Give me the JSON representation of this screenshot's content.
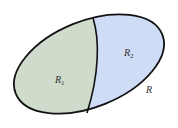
{
  "diagram": {
    "type": "region-partition",
    "region": {
      "label": "R",
      "shape": "ellipse"
    },
    "subregions": [
      {
        "label": "R",
        "subscript": "1",
        "fill": "#cfdccb"
      },
      {
        "label": "R",
        "subscript": "2",
        "fill": "#cfdcf5"
      }
    ],
    "outline_color": "#111111"
  }
}
